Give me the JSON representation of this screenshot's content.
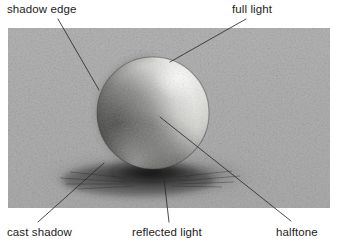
{
  "figure": {
    "frame": {
      "x": 8,
      "y": 28,
      "width": 322,
      "height": 180
    },
    "background_color": "#c8c8c8",
    "ink_color": "#1c1c1c",
    "light_direction": "upper-right",
    "medium": "graphite pencil drawing"
  },
  "sphere": {
    "center_x": 153,
    "center_y": 113,
    "radius": 56,
    "highlight_x": 178,
    "highlight_y": 78,
    "highlight_color": "#f2f2f0",
    "core_shadow_color": "#3a3a3a"
  },
  "cast_shadow": {
    "center_x": 150,
    "center_y": 176,
    "radius_x": 98,
    "radius_y": 20,
    "color": "#2e2e2e"
  },
  "callouts": [
    {
      "id": "shadow-edge",
      "label": "shadow edge",
      "text_x": 7,
      "text_y": 3,
      "leader": {
        "x1": 58,
        "y1": 19,
        "x2": 99,
        "y2": 90
      }
    },
    {
      "id": "full-light",
      "label": "full light",
      "text_x": 232,
      "text_y": 3,
      "leader": {
        "x1": 246,
        "y1": 19,
        "x2": 170,
        "y2": 62
      }
    },
    {
      "id": "cast-shadow",
      "label": "cast shadow",
      "text_x": 7,
      "text_y": 226,
      "leader": {
        "x1": 38,
        "y1": 222,
        "x2": 104,
        "y2": 163
      }
    },
    {
      "id": "reflected-light",
      "label": "reflected light",
      "text_x": 132,
      "text_y": 226,
      "leader": {
        "x1": 169,
        "y1": 222,
        "x2": 163,
        "y2": 170
      }
    },
    {
      "id": "halftone",
      "label": "halftone",
      "text_x": 276,
      "text_y": 226,
      "leader": {
        "x1": 291,
        "y1": 221,
        "x2": 160,
        "y2": 117
      }
    }
  ]
}
